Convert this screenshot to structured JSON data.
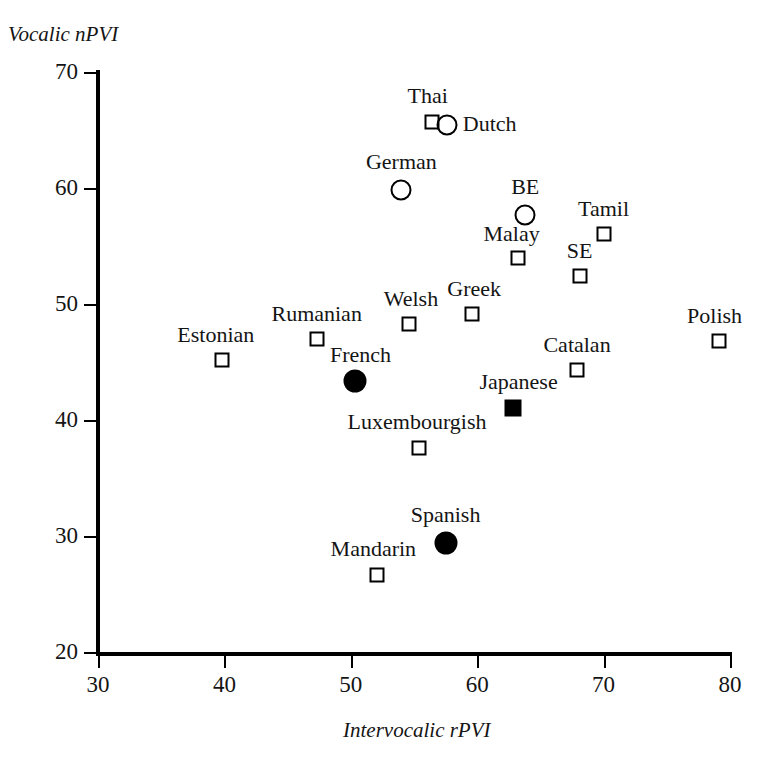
{
  "chart_data": {
    "type": "scatter",
    "title": "",
    "xlabel": "Intervocalic rPVI",
    "ylabel": "Vocalic nPVI",
    "xlim": [
      30,
      80
    ],
    "ylim": [
      20,
      70
    ],
    "xticks": [
      30,
      40,
      50,
      60,
      70,
      80
    ],
    "yticks": [
      20,
      30,
      40,
      50,
      60,
      70
    ],
    "grid": false,
    "legend": "none",
    "points": [
      {
        "label": "Thai",
        "x": 56.4,
        "y": 65.7,
        "marker": "square-open",
        "label_dx": -4,
        "label_dy": -26,
        "label_anchor": "center"
      },
      {
        "label": "Dutch",
        "x": 57.6,
        "y": 65.4,
        "marker": "circle-open",
        "label_dx": 16,
        "label_dy": -1,
        "label_anchor": "left"
      },
      {
        "label": "German",
        "x": 54.0,
        "y": 59.8,
        "marker": "circle-open",
        "label_dx": 0,
        "label_dy": -28,
        "label_anchor": "center"
      },
      {
        "label": "BE",
        "x": 63.8,
        "y": 57.7,
        "marker": "circle-open",
        "label_dx": 0,
        "label_dy": -28,
        "label_anchor": "center"
      },
      {
        "label": "Tamil",
        "x": 70.0,
        "y": 56.0,
        "marker": "square-open",
        "label_dx": 0,
        "label_dy": -25,
        "label_anchor": "center"
      },
      {
        "label": "Malay",
        "x": 63.2,
        "y": 54.0,
        "marker": "square-open",
        "label_dx": -6,
        "label_dy": -24,
        "label_anchor": "center"
      },
      {
        "label": "SE",
        "x": 68.1,
        "y": 52.4,
        "marker": "square-open",
        "label_dx": 0,
        "label_dy": -25,
        "label_anchor": "center"
      },
      {
        "label": "Greek",
        "x": 59.6,
        "y": 49.1,
        "marker": "square-open",
        "label_dx": 2,
        "label_dy": -25,
        "label_anchor": "center"
      },
      {
        "label": "Welsh",
        "x": 54.6,
        "y": 48.3,
        "marker": "square-open",
        "label_dx": 2,
        "label_dy": -25,
        "label_anchor": "center"
      },
      {
        "label": "Rumanian",
        "x": 47.3,
        "y": 47.0,
        "marker": "square-open",
        "label_dx": 0,
        "label_dy": -25,
        "label_anchor": "center"
      },
      {
        "label": "Polish",
        "x": 79.1,
        "y": 46.8,
        "marker": "square-open",
        "label_dx": -4,
        "label_dy": -25,
        "label_anchor": "center"
      },
      {
        "label": "Estonian",
        "x": 39.8,
        "y": 45.2,
        "marker": "square-open",
        "label_dx": -6,
        "label_dy": -25,
        "label_anchor": "center"
      },
      {
        "label": "Catalan",
        "x": 67.9,
        "y": 44.3,
        "marker": "square-open",
        "label_dx": 0,
        "label_dy": -25,
        "label_anchor": "center"
      },
      {
        "label": "French",
        "x": 50.3,
        "y": 43.4,
        "marker": "circle-filled",
        "label_dx": 6,
        "label_dy": -26,
        "label_anchor": "center"
      },
      {
        "label": "Japanese",
        "x": 62.8,
        "y": 41.0,
        "marker": "square-filled",
        "label_dx": 6,
        "label_dy": -26,
        "label_anchor": "center"
      },
      {
        "label": "Luxembourgish",
        "x": 55.4,
        "y": 37.6,
        "marker": "square-open",
        "label_dx": -2,
        "label_dy": -26,
        "label_anchor": "center"
      },
      {
        "label": "Spanish",
        "x": 57.5,
        "y": 29.4,
        "marker": "circle-filled",
        "label_dx": 0,
        "label_dy": -28,
        "label_anchor": "center"
      },
      {
        "label": "Mandarin",
        "x": 52.1,
        "y": 26.6,
        "marker": "square-open",
        "label_dx": -4,
        "label_dy": -26,
        "label_anchor": "center"
      }
    ]
  },
  "colors": {
    "axis": "#000000",
    "text": "#141414",
    "marker": "#000000",
    "background": "#ffffff"
  }
}
